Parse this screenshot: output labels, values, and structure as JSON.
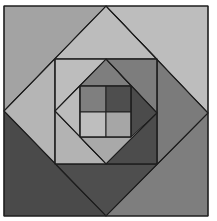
{
  "diagram": {
    "title": "",
    "stroke_color": "#1e1e1e",
    "background": "#ffffff",
    "layers": {
      "outer_square": {
        "bounds": [
          4,
          6,
          208,
          216
        ],
        "corner_triangles": {
          "top_left": "#a3a3a3",
          "top_right": "#bdbdbd",
          "bottom_left": "#4a4a4a",
          "bottom_right": "#7e7e7e"
        }
      },
      "large_diamond": {
        "vertices": {
          "top": [
            106,
            6
          ],
          "right": [
            208,
            113
          ],
          "bottom": [
            106,
            216
          ],
          "left": [
            4,
            111
          ]
        },
        "corner_triangles": {
          "top": "#bcbcbc",
          "right": "#7b7b7b",
          "bottom": "#4e4e4e",
          "left": "#b5b5b5"
        }
      },
      "middle_square": {
        "bounds": [
          55,
          59,
          157,
          164
        ],
        "corner_triangles": {
          "top_left": "#bdbdbd",
          "top_right": "#7d7d7d",
          "bottom_left": "#b3b3b3",
          "bottom_right": "#4c4c4c"
        }
      },
      "inner_diamond": {
        "vertices": {
          "top": [
            106,
            59
          ],
          "right": [
            157,
            113
          ],
          "bottom": [
            106,
            164
          ],
          "left": [
            55,
            111
          ]
        },
        "corner_triangles": {
          "top": "#7e7e7e",
          "right": "#4b4b4b",
          "bottom": "#a9a9a9",
          "left": "#bcbcbc"
        }
      },
      "center_grid": {
        "bounds": [
          80,
          86,
          131,
          137
        ],
        "split": [
          106,
          112
        ],
        "cells": {
          "top_left": "#7f7f7f",
          "top_right": "#4e4e4e",
          "bottom_left": "#bebebe",
          "bottom_right": "#a6a6a6"
        }
      }
    }
  }
}
